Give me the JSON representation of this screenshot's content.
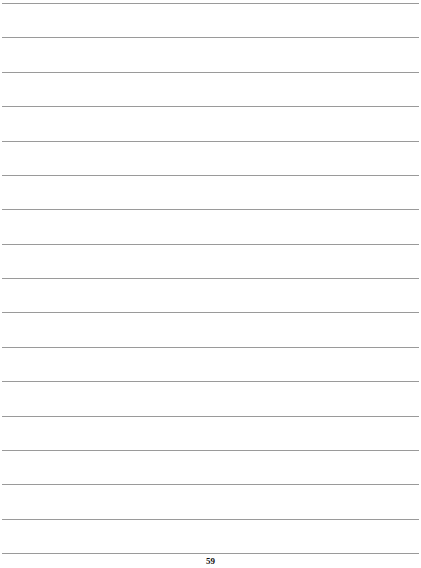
{
  "page": {
    "type": "lined-notes-page",
    "line_count": 17,
    "line_color": "#9a9a9a",
    "page_number": "59"
  }
}
